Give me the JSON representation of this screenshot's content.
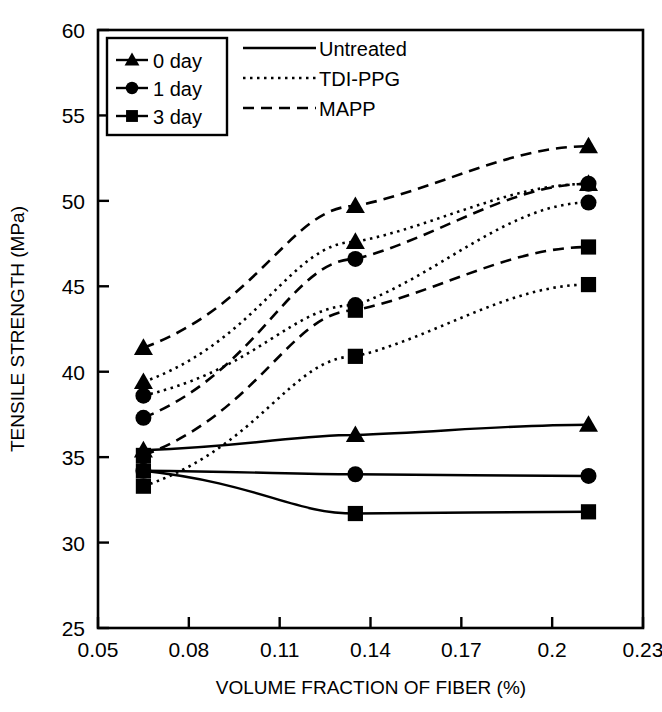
{
  "chart_data": {
    "type": "line",
    "title": "",
    "xlabel": "VOLUME FRACTION OF FIBER (%)",
    "ylabel": "TENSILE STRENGTH (MPa)",
    "xlim": [
      0.05,
      0.23
    ],
    "ylim": [
      25,
      60
    ],
    "xticks": [
      "0.05",
      "0.08",
      "0.11",
      "0.14",
      "0.17",
      "0.2",
      "0.23"
    ],
    "xtick_values": [
      0.05,
      0.08,
      0.11,
      0.14,
      0.17,
      0.2,
      0.23
    ],
    "yticks": [
      "25",
      "30",
      "35",
      "40",
      "45",
      "50",
      "55",
      "60"
    ],
    "ytick_values": [
      25,
      30,
      35,
      40,
      45,
      50,
      55,
      60
    ],
    "grid": false,
    "x": [
      0.065,
      0.135,
      0.212
    ],
    "legend_position": "top-left-inside",
    "marker_legend": {
      "title": "",
      "entries": [
        {
          "label": "0 day",
          "marker": "triangle"
        },
        {
          "label": "1 day",
          "marker": "circle"
        },
        {
          "label": "3 day",
          "marker": "square"
        }
      ]
    },
    "line_legend": {
      "entries": [
        {
          "label": "Untreated",
          "dash": "solid"
        },
        {
          "label": "TDI-PPG",
          "dash": "dotted"
        },
        {
          "label": "MAPP",
          "dash": "dashed"
        }
      ]
    },
    "series": [
      {
        "name": "MAPP 0 day",
        "treatment": "MAPP",
        "aging": "0 day",
        "marker": "triangle",
        "dash": "dashed",
        "values": [
          41.4,
          49.7,
          53.2
        ]
      },
      {
        "name": "MAPP 1 day",
        "treatment": "MAPP",
        "aging": "1 day",
        "marker": "circle",
        "dash": "dashed",
        "values": [
          37.3,
          46.6,
          51.0
        ]
      },
      {
        "name": "MAPP 3 day",
        "treatment": "MAPP",
        "aging": "3 day",
        "marker": "square",
        "dash": "dashed",
        "values": [
          35.1,
          43.6,
          47.3
        ]
      },
      {
        "name": "TDI-PPG 0 day",
        "treatment": "TDI-PPG",
        "aging": "0 day",
        "marker": "triangle",
        "dash": "dotted",
        "values": [
          39.4,
          47.6,
          51.0
        ]
      },
      {
        "name": "TDI-PPG 1 day",
        "treatment": "TDI-PPG",
        "aging": "1 day",
        "marker": "circle",
        "dash": "dotted",
        "values": [
          38.6,
          43.9,
          49.9
        ]
      },
      {
        "name": "TDI-PPG 3 day",
        "treatment": "TDI-PPG",
        "aging": "3 day",
        "marker": "square",
        "dash": "dotted",
        "values": [
          33.3,
          40.9,
          45.1
        ]
      },
      {
        "name": "Untreated 0 day",
        "treatment": "Untreated",
        "aging": "0 day",
        "marker": "triangle",
        "dash": "solid",
        "values": [
          35.4,
          36.3,
          36.9
        ]
      },
      {
        "name": "Untreated 1 day",
        "treatment": "Untreated",
        "aging": "1 day",
        "marker": "circle",
        "dash": "solid",
        "values": [
          34.2,
          34.0,
          33.9
        ]
      },
      {
        "name": "Untreated 3 day",
        "treatment": "Untreated",
        "aging": "3 day",
        "marker": "square",
        "dash": "solid",
        "values": [
          34.2,
          31.7,
          31.8
        ]
      }
    ]
  }
}
